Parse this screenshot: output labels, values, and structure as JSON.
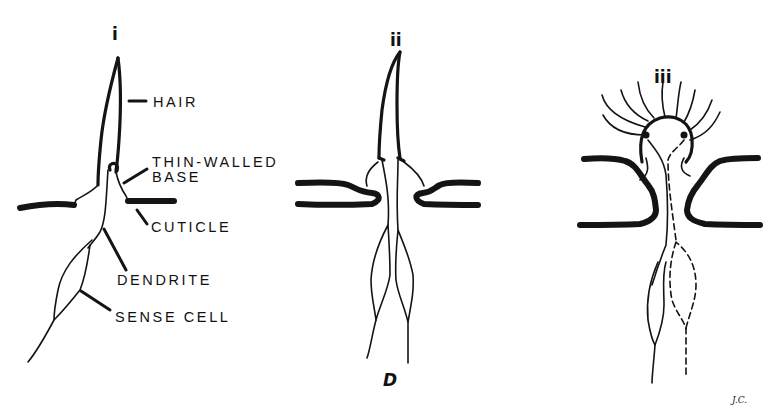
{
  "figure": {
    "letter": "D",
    "signature": "J.C.",
    "panels": [
      {
        "id": "i",
        "label": "i"
      },
      {
        "id": "ii",
        "label": "ii"
      },
      {
        "id": "iii",
        "label": "iii"
      }
    ],
    "labels": {
      "hair": "HAIR",
      "thin_walled_line1": "THIN-WALLED",
      "thin_walled_line2": "BASE",
      "cuticle": "CUTICLE",
      "dendrite": "DENDRITE",
      "sense_cell": "SENSE CELL"
    }
  }
}
